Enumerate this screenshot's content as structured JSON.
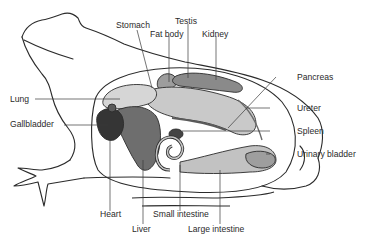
{
  "diagram": {
    "labels": {
      "stomach": "Stomach",
      "testis": "Testis",
      "fat_body": "Fat body",
      "kidney": "Kidney",
      "pancreas": "Pancreas",
      "lung": "Lung",
      "gallbladder": "Gallbladder",
      "ureter": "Ureter",
      "spleen": "Spleen",
      "urinary_bladder": "Urinary bladder",
      "heart": "Heart",
      "liver": "Liver",
      "small_intestine": "Small intestine",
      "large_intestine": "Large intestine"
    },
    "colors": {
      "outline": "#2b2b2b",
      "leader": "#3a3a3a",
      "organ_light": "#cfcfcf",
      "organ_mid": "#a8a8a8",
      "organ_dark": "#555555",
      "heart": "#3a3a3a"
    }
  }
}
